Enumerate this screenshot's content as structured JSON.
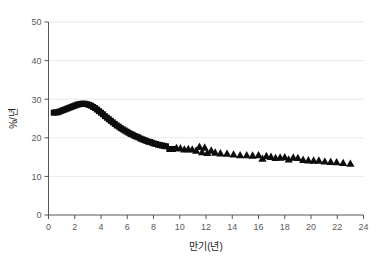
{
  "figure": {
    "background_color": "#ffffff",
    "marker_color": "#0d0d0d",
    "grid_color": "#e9e9e9",
    "axis_color": "#555555"
  },
  "chart_data": {
    "type": "scatter",
    "title": "",
    "subtitle": "",
    "xlabel": "만기(년)",
    "ylabel": "%/년",
    "xlim": [
      0,
      24
    ],
    "ylim": [
      0,
      50
    ],
    "xticks": [
      0,
      2,
      4,
      6,
      8,
      10,
      12,
      14,
      16,
      18,
      20,
      22,
      24
    ],
    "yticks": [
      0,
      10,
      20,
      30,
      40,
      50
    ],
    "xtick_labels": [
      "0",
      "2",
      "4",
      "6",
      "8",
      "10",
      "12",
      "14",
      "16",
      "18",
      "20",
      "22",
      "24"
    ],
    "ytick_labels": [
      "0",
      "10",
      "20",
      "30",
      "40",
      "50"
    ],
    "grid": "horizontal",
    "legend": "none",
    "annotations": [],
    "series": [
      {
        "name": "series-squares",
        "marker": "square",
        "color": "#0d0d0d",
        "points": [
          [
            0.4,
            26.5
          ],
          [
            0.55,
            26.6
          ],
          [
            0.7,
            26.6
          ],
          [
            0.85,
            26.8
          ],
          [
            1.0,
            27.0
          ],
          [
            1.15,
            27.2
          ],
          [
            1.3,
            27.4
          ],
          [
            1.45,
            27.6
          ],
          [
            1.6,
            27.8
          ],
          [
            1.75,
            28.0
          ],
          [
            1.9,
            28.2
          ],
          [
            2.05,
            28.4
          ],
          [
            2.2,
            28.6
          ],
          [
            2.35,
            28.7
          ],
          [
            2.5,
            28.8
          ],
          [
            2.65,
            28.85
          ],
          [
            2.8,
            28.8
          ],
          [
            2.95,
            28.7
          ],
          [
            3.1,
            28.5
          ],
          [
            3.25,
            28.3
          ],
          [
            3.4,
            28.0
          ],
          [
            3.55,
            27.7
          ],
          [
            3.7,
            27.3
          ],
          [
            3.85,
            26.9
          ],
          [
            4.0,
            26.5
          ],
          [
            4.15,
            26.1
          ],
          [
            4.3,
            25.6
          ],
          [
            4.45,
            25.2
          ],
          [
            4.6,
            24.8
          ],
          [
            4.75,
            24.4
          ],
          [
            4.9,
            24.0
          ],
          [
            5.05,
            23.6
          ],
          [
            5.2,
            23.2
          ],
          [
            5.35,
            22.9
          ],
          [
            5.5,
            22.5
          ],
          [
            5.65,
            22.2
          ],
          [
            5.8,
            21.9
          ],
          [
            5.95,
            21.6
          ],
          [
            6.1,
            21.3
          ],
          [
            6.25,
            21.0
          ],
          [
            6.4,
            20.8
          ],
          [
            6.55,
            20.5
          ],
          [
            6.7,
            20.3
          ],
          [
            6.85,
            20.1
          ],
          [
            7.0,
            19.8
          ],
          [
            7.15,
            19.6
          ],
          [
            7.3,
            19.4
          ],
          [
            7.45,
            19.2
          ],
          [
            7.6,
            19.0
          ],
          [
            7.75,
            18.9
          ],
          [
            7.9,
            18.7
          ],
          [
            8.05,
            18.5
          ],
          [
            8.2,
            18.4
          ],
          [
            8.35,
            18.2
          ],
          [
            8.5,
            18.1
          ],
          [
            8.65,
            18.0
          ],
          [
            8.8,
            17.9
          ],
          [
            8.95,
            17.8
          ],
          [
            9.2,
            17.1
          ],
          [
            9.5,
            17.1
          ]
        ]
      },
      {
        "name": "series-triangles",
        "marker": "triangle",
        "color": "#0d0d0d",
        "points": [
          [
            9.75,
            17.3
          ],
          [
            10.05,
            17.2
          ],
          [
            10.35,
            16.9
          ],
          [
            10.65,
            17.0
          ],
          [
            10.95,
            16.9
          ],
          [
            11.25,
            16.6
          ],
          [
            11.5,
            17.6
          ],
          [
            11.7,
            16.2
          ],
          [
            11.9,
            17.4
          ],
          [
            12.1,
            16.0
          ],
          [
            12.4,
            16.6
          ],
          [
            12.7,
            16.1
          ],
          [
            13.1,
            15.9
          ],
          [
            13.6,
            15.8
          ],
          [
            14.1,
            15.6
          ],
          [
            14.6,
            15.4
          ],
          [
            15.1,
            15.4
          ],
          [
            15.55,
            15.3
          ],
          [
            16.0,
            15.4
          ],
          [
            16.3,
            14.5
          ],
          [
            16.6,
            15.2
          ],
          [
            16.95,
            15.0
          ],
          [
            17.3,
            14.7
          ],
          [
            17.65,
            14.8
          ],
          [
            18.0,
            14.9
          ],
          [
            18.3,
            14.3
          ],
          [
            18.65,
            14.8
          ],
          [
            19.0,
            14.7
          ],
          [
            19.4,
            14.2
          ],
          [
            19.8,
            14.1
          ],
          [
            20.2,
            14.0
          ],
          [
            20.6,
            14.0
          ],
          [
            21.05,
            13.8
          ],
          [
            21.5,
            13.7
          ],
          [
            21.95,
            13.6
          ],
          [
            22.45,
            13.4
          ],
          [
            23.0,
            13.2
          ]
        ]
      }
    ]
  }
}
